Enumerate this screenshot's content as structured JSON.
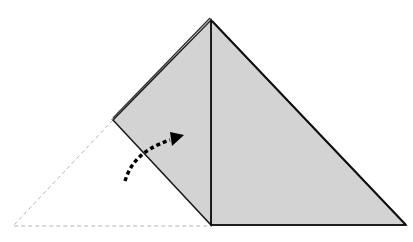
{
  "diagram": {
    "type": "origami-fold-step",
    "colors": {
      "paper_fill": "#d3d3d3",
      "edge": "#1a1a1a",
      "dashed_outline": "#b5b5b5",
      "arrow": "#000000",
      "background": "#ffffff"
    },
    "shapes": {
      "right_triangle_points": "211,20 406,225 211,225",
      "left_flap_points": "211,20 113,120 211,225",
      "ghost_triangle_points": "113,120 13,226 211,226",
      "center_crease": {
        "x1": 211,
        "y1": 20,
        "x2": 211,
        "y2": 225
      }
    },
    "arrow": {
      "meaning": "fold flap upward / toward the right",
      "path": "M125,181 C130,165 140,150 170,140"
    }
  }
}
